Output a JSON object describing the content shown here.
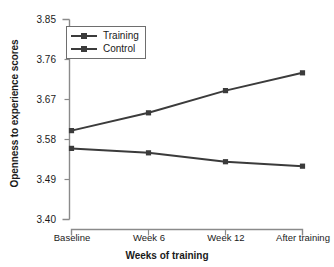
{
  "chart_data": {
    "type": "line",
    "title": "",
    "xlabel": "Weeks of training",
    "ylabel": "Openness to experience scores",
    "categories": [
      "Baseline",
      "Week 6",
      "Week 12",
      "After training"
    ],
    "series": [
      {
        "name": "Training",
        "values": [
          3.6,
          3.64,
          3.69,
          3.73
        ]
      },
      {
        "name": "Control",
        "values": [
          3.56,
          3.55,
          3.53,
          3.52
        ]
      }
    ],
    "ylim": [
      3.4,
      3.85
    ],
    "yticks": [
      "3.85",
      "3.76",
      "3.67",
      "3.58",
      "3.49",
      "3.40"
    ],
    "ytick_values": [
      3.85,
      3.76,
      3.67,
      3.58,
      3.49,
      3.4
    ],
    "grid": false,
    "legend_position": "top-left",
    "line_color": "#3b3b3b",
    "axis_color": "#8a8a8a",
    "marker": "square"
  },
  "legend": {
    "items": [
      {
        "label": "Training"
      },
      {
        "label": "Control"
      }
    ]
  }
}
